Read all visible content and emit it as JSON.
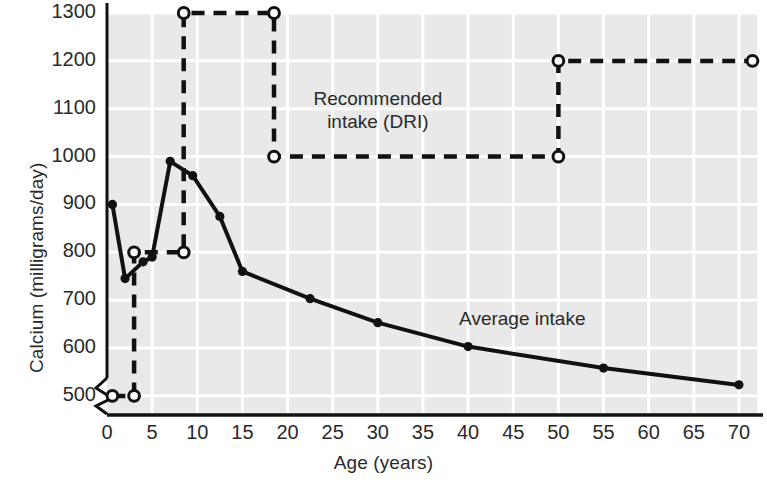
{
  "chart_data": {
    "type": "line",
    "title": "",
    "xlabel": "Age (years)",
    "ylabel": "Calcium (milligrams/day)",
    "xlim": [
      0,
      72
    ],
    "ylim": [
      460,
      1300
    ],
    "y_axis_break": true,
    "grid": true,
    "background_color": "#e9e9e9",
    "gridline_color": "#ffffff",
    "line_color": "#111111",
    "xticks": [
      0,
      5,
      10,
      15,
      20,
      25,
      30,
      35,
      40,
      45,
      50,
      55,
      60,
      65,
      70
    ],
    "xtick_labels": [
      "0",
      "5",
      "10",
      "15",
      "20",
      "25",
      "30",
      "35",
      "40",
      "45",
      "50",
      "55",
      "60",
      "65",
      "70"
    ],
    "yticks": [
      500,
      600,
      700,
      800,
      900,
      1000,
      1100,
      1200,
      1300
    ],
    "ytick_labels": [
      "500",
      "600",
      "700",
      "800",
      "900",
      "1000",
      "1100",
      "1200",
      "1300"
    ],
    "series": [
      {
        "name": "Average intake",
        "style": "solid",
        "marker": "filled-circle",
        "x": [
          0.6,
          2.0,
          4.0,
          5.0,
          7.0,
          9.5,
          12.5,
          15.0,
          22.5,
          30.0,
          40.0,
          55.0,
          70.0
        ],
        "values": [
          900,
          745,
          780,
          790,
          990,
          960,
          875,
          760,
          703,
          653,
          603,
          558,
          523
        ]
      },
      {
        "name": "Recommended intake (DRI)",
        "style": "dashed",
        "marker": "open-circle",
        "steps": [
          {
            "x_start": 0.6,
            "x_end": 3.0,
            "y": 500
          },
          {
            "x_start": 3.0,
            "x_end": 8.5,
            "y": 800
          },
          {
            "x_start": 8.5,
            "x_end": 18.5,
            "y": 1300
          },
          {
            "x_start": 18.5,
            "x_end": 50.0,
            "y": 1000
          },
          {
            "x_start": 50.0,
            "x_end": 71.5,
            "y": 1200
          }
        ],
        "x": [
          0.6,
          3.0,
          3.0,
          8.5,
          8.5,
          18.5,
          18.5,
          50.0,
          50.0,
          71.5
        ],
        "values": [
          500,
          500,
          800,
          800,
          1300,
          1300,
          1000,
          1000,
          1200,
          1200
        ]
      }
    ],
    "annotations": [
      {
        "name": "dri-label",
        "line1": "Recommended",
        "line2": "intake (DRI)",
        "x": 30.0,
        "y": 1100
      },
      {
        "name": "average-label",
        "line1": "Average intake",
        "line2": "",
        "x": 46.0,
        "y": 660
      }
    ]
  },
  "labels": {
    "ylabel": "Calcium (milligrams/day)",
    "xlabel": "Age (years)",
    "dri_line1": "Recommended",
    "dri_line2": "intake (DRI)",
    "average_label": "Average intake"
  }
}
